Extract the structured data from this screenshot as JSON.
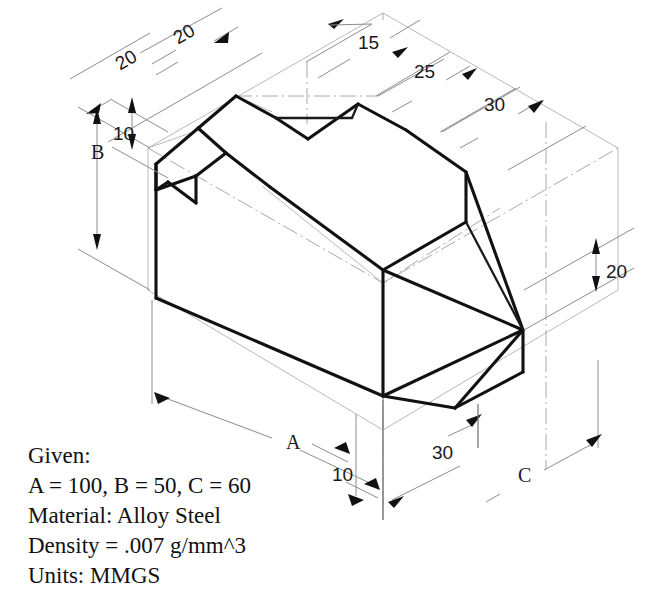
{
  "drawing": {
    "type": "isometric-engineering-drawing",
    "projection": "isometric",
    "background_color": "#ffffff",
    "line_color": "#111111",
    "construction_line_color": "#b9b9b9",
    "dimension_line_color": "#8c8c8c"
  },
  "dimensions": [
    {
      "id": "d-top-left-20",
      "label": "20",
      "rotation": -30,
      "x": 112,
      "y": 57,
      "location": "top-left-outer"
    },
    {
      "id": "d-top-20b",
      "label": "20",
      "rotation": -30,
      "x": 170,
      "y": 31,
      "location": "top-left-inner"
    },
    {
      "id": "d-top-15",
      "label": "15",
      "rotation": 0,
      "x": 358,
      "y": 33,
      "location": "top-center"
    },
    {
      "id": "d-top-25",
      "label": "25",
      "rotation": 0,
      "x": 414,
      "y": 62,
      "location": "top-right-inner"
    },
    {
      "id": "d-top-30",
      "label": "30",
      "rotation": 0,
      "x": 484,
      "y": 95,
      "location": "top-right-outer"
    },
    {
      "id": "d-left-B",
      "label": "B",
      "rotation": 0,
      "x": 91,
      "y": 142,
      "location": "left-height"
    },
    {
      "id": "d-left-10",
      "label": "10",
      "rotation": 0,
      "x": 113,
      "y": 124,
      "location": "left-upper-step"
    },
    {
      "id": "d-right-20",
      "label": "20",
      "rotation": 0,
      "x": 606,
      "y": 262,
      "location": "right-depth"
    },
    {
      "id": "d-bottom-A",
      "label": "A",
      "rotation": 0,
      "x": 286,
      "y": 432,
      "location": "bottom-left-width"
    },
    {
      "id": "d-bottom-10",
      "label": "10",
      "rotation": 0,
      "x": 332,
      "y": 465,
      "location": "bottom-center-small"
    },
    {
      "id": "d-bottom-30",
      "label": "30",
      "rotation": 0,
      "x": 432,
      "y": 443,
      "location": "bottom-center"
    },
    {
      "id": "d-bottom-C",
      "label": "C",
      "rotation": 0,
      "x": 518,
      "y": 465,
      "location": "bottom-right-depth"
    }
  ],
  "notes": {
    "title": "Given:",
    "lines": [
      "Given:",
      "A = 100, B = 50, C = 60",
      "Material: Alloy Steel",
      "Density = .007 g/mm^3",
      "Units: MMGS"
    ],
    "line_1": "Given:",
    "line_2": "A = 100, B = 50, C = 60",
    "line_3": "Material: Alloy Steel",
    "line_4": "Density = .007 g/mm^3",
    "line_5": "Units: MMGS"
  },
  "parameters": {
    "A": "100",
    "B": "50",
    "C": "60",
    "material": "Alloy Steel",
    "density": ".007 g/mm^3",
    "units": "MMGS"
  }
}
